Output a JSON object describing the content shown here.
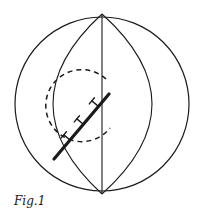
{
  "figure": {
    "caption": "Fig.1",
    "stroke_color": "#1a1a1a",
    "background": "#ffffff",
    "elements": {
      "outer_sphere": {
        "cx": 102,
        "cy": 104,
        "r": 87
      },
      "meridian_vertical": {
        "x": 102,
        "y1": 14,
        "y2": 194
      },
      "lens_left_arc": {
        "from": [
          102,
          14
        ],
        "via_x": 53,
        "to": [
          102,
          194
        ]
      },
      "lens_right_arc": {
        "from": [
          102,
          14
        ],
        "via_x": 152,
        "to": [
          102,
          194
        ]
      },
      "dashed_circle": {
        "cx": 80,
        "cy": 108,
        "r": 36,
        "dasharray": "5 4"
      },
      "thick_line": {
        "x1": 54,
        "y1": 159,
        "x2": 109,
        "y2": 94,
        "width": 3.2
      },
      "dislocation_markers": [
        {
          "x": 98,
          "y": 107
        },
        {
          "x": 82,
          "y": 126
        },
        {
          "x": 69,
          "y": 141
        }
      ]
    }
  }
}
